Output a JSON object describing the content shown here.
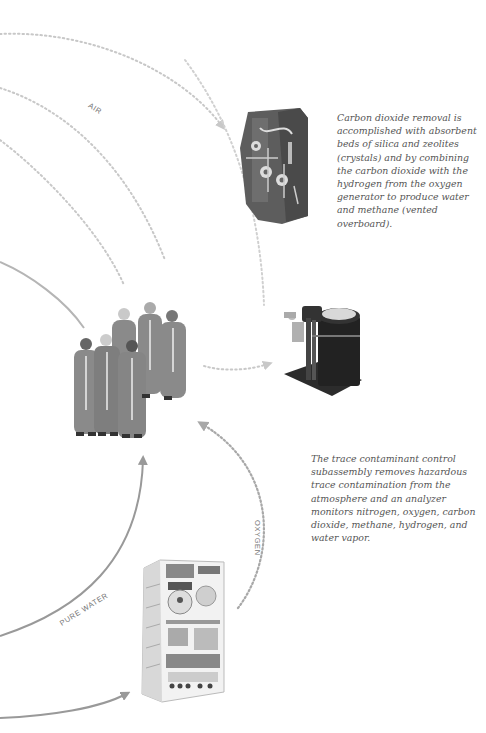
{
  "diagram": {
    "type": "life-support-flow",
    "colors": {
      "dotted_flow": "#c8c8c8",
      "dotted_oxygen": "#a8a8a8",
      "solid_water": "#999999",
      "text": "#555555",
      "label": "#777777"
    },
    "labels": {
      "air": "AIR",
      "oxygen": "OXYGEN",
      "pure_water": "PURE WATER"
    },
    "captions": {
      "co2_removal": "Carbon dioxide removal is accomplished with absorbent beds of silica and zeolites (crystals) and by combining the carbon dioxide with the hydrogen from the oxygen generator to produce water and methane (vented overboard).",
      "trace_contaminant": "The trace contaminant control subassembly removes hazardous trace contamination from the atmosphere and an analyzer monitors nitrogen, oxygen, carbon dioxide, methane, hydrogen, and water vapor."
    },
    "components": [
      {
        "id": "co2-removal-assembly",
        "label": "Carbon dioxide removal assembly"
      },
      {
        "id": "trace-contaminant-unit",
        "label": "Trace contaminant control subassembly"
      },
      {
        "id": "crew",
        "label": "Crew"
      },
      {
        "id": "oxygen-generator-rack",
        "label": "Oxygen generation system rack"
      }
    ]
  }
}
